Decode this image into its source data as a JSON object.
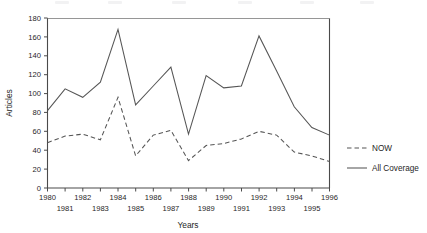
{
  "figure": {
    "axis_label_y": "Articles",
    "axis_label_x": "Years"
  },
  "legend": {
    "position": "right",
    "items": [
      {
        "label": "NOW",
        "style": "dashed",
        "color": "#555555"
      },
      {
        "label": "All Coverage",
        "style": "solid",
        "color": "#555555"
      }
    ]
  },
  "axes": {
    "y_ticks": [
      "0",
      "20",
      "40",
      "60",
      "80",
      "100",
      "120",
      "140",
      "160",
      "180"
    ],
    "x_ticks_top": [
      "1980",
      "1982",
      "1984",
      "1986",
      "1988",
      "1990",
      "1992",
      "1994",
      "1996"
    ],
    "x_ticks_bottom": [
      "1981",
      "1983",
      "1985",
      "1987",
      "1989",
      "1991",
      "1993",
      "1995"
    ]
  },
  "chart_data": {
    "type": "line",
    "title": "",
    "xlabel": "Years",
    "ylabel": "Articles",
    "xlim": [
      1980,
      1996
    ],
    "ylim": [
      0,
      180
    ],
    "grid": false,
    "legend_position": "right",
    "x": [
      1980,
      1981,
      1982,
      1983,
      1984,
      1985,
      1986,
      1987,
      1988,
      1989,
      1990,
      1991,
      1992,
      1993,
      1994,
      1995,
      1996
    ],
    "series": [
      {
        "name": "All Coverage",
        "style": "solid",
        "color": "#555555",
        "values": [
          82,
          105,
          96,
          112,
          168,
          88,
          108,
          128,
          57,
          119,
          106,
          108,
          161,
          124,
          86,
          64,
          56
        ]
      },
      {
        "name": "NOW",
        "style": "dashed",
        "color": "#555555",
        "values": [
          48,
          55,
          57,
          51,
          96,
          34,
          56,
          61,
          29,
          45,
          47,
          52,
          60,
          56,
          38,
          34,
          28
        ]
      }
    ]
  }
}
